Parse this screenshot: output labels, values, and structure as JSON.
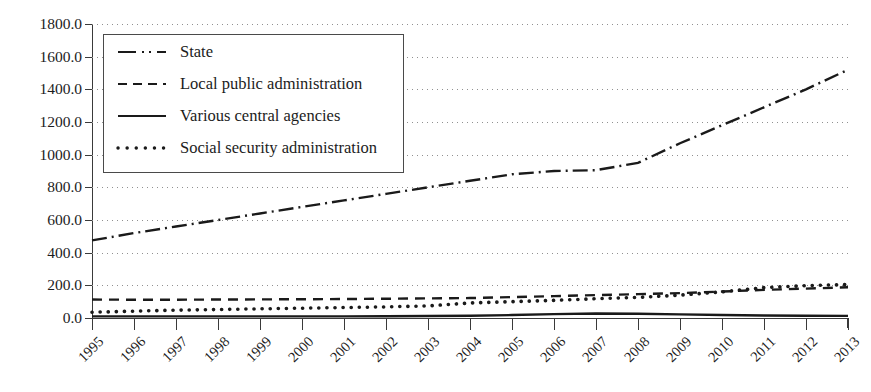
{
  "chart_data": {
    "type": "line",
    "title": "",
    "xlabel": "",
    "ylabel": "",
    "categories": [
      "1995",
      "1996",
      "1997",
      "1998",
      "1999",
      "2000",
      "2001",
      "2002",
      "2003",
      "2004",
      "2005",
      "2006",
      "2007",
      "2008",
      "2009",
      "2010",
      "2011",
      "2012",
      "2013"
    ],
    "ylim": [
      0,
      1800
    ],
    "ytick_step": 200,
    "ytick_labels": [
      "0.0",
      "200.0",
      "400.0",
      "600.0",
      "800.0",
      "1000.0",
      "1200.0",
      "1400.0",
      "1600.0",
      "1800.0"
    ],
    "grid": true,
    "grid_style": "dotted-horizontal",
    "legend_position": "upper-left-inside",
    "series": [
      {
        "name": "State",
        "style": "dash-dot",
        "color": "#1a1a1a",
        "values": [
          475,
          520,
          560,
          600,
          640,
          680,
          720,
          760,
          800,
          840,
          880,
          900,
          905,
          950,
          1070,
          1180,
          1290,
          1400,
          1520
        ]
      },
      {
        "name": "Local public administration",
        "style": "dashed",
        "color": "#1a1a1a",
        "values": [
          113,
          112,
          112,
          113,
          114,
          115,
          116,
          118,
          120,
          122,
          128,
          134,
          140,
          146,
          152,
          162,
          172,
          180,
          188
        ]
      },
      {
        "name": "Various central agencies",
        "style": "solid",
        "color": "#1a1a1a",
        "values": [
          10,
          10,
          10,
          10,
          10,
          10,
          10,
          11,
          12,
          14,
          18,
          24,
          28,
          26,
          22,
          18,
          15,
          14,
          13
        ]
      },
      {
        "name": "Social security administration",
        "style": "dotted",
        "color": "#1a1a1a",
        "values": [
          35,
          42,
          48,
          52,
          56,
          60,
          64,
          68,
          74,
          92,
          100,
          108,
          118,
          126,
          140,
          160,
          186,
          198,
          205
        ]
      }
    ]
  },
  "axes": {
    "y_labels": [
      "1800.0",
      "1600.0",
      "1400.0",
      "1200.0",
      "1000.0",
      "800.0",
      "600.0",
      "400.0",
      "200.0",
      "0.0"
    ],
    "x_labels": [
      "1995",
      "1996",
      "1997",
      "1998",
      "1999",
      "2000",
      "2001",
      "2002",
      "2003",
      "2004",
      "2005",
      "2006",
      "2007",
      "2008",
      "2009",
      "2010",
      "2011",
      "2012",
      "2013"
    ]
  },
  "legend": {
    "entries": [
      {
        "label": "State",
        "style": "dash-dot"
      },
      {
        "label": "Local public administration",
        "style": "dashed"
      },
      {
        "label": "Various central agencies",
        "style": "solid"
      },
      {
        "label": "Social security administration",
        "style": "dotted"
      }
    ]
  }
}
